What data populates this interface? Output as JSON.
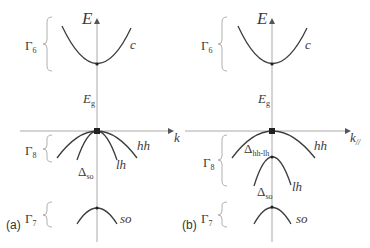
{
  "diagram": {
    "type": "band-structure",
    "panels": [
      {
        "tag": "(a)",
        "axis_y_label": "E",
        "axis_x_label": "k",
        "gap_label": "E",
        "gap_label_sub": "g",
        "bands": [
          {
            "name": "c",
            "region": "Γ6",
            "region_sub": "6"
          },
          {
            "name": "hh",
            "region": "Γ8"
          },
          {
            "name": "lh",
            "region": "Γ8"
          },
          {
            "name": "so",
            "region": "Γ7"
          }
        ],
        "regions": {
          "g6": "Γ",
          "g6_sub": "6",
          "g8": "Γ",
          "g8_sub": "8",
          "g7": "Γ",
          "g7_sub": "7"
        },
        "delta_so": "Δ",
        "delta_so_sub": "so"
      },
      {
        "tag": "(b)",
        "axis_y_label": "E",
        "axis_x_label": "k",
        "axis_x_sub": "//",
        "gap_label": "E",
        "gap_label_sub": "g",
        "bands": [
          {
            "name": "c"
          },
          {
            "name": "hh"
          },
          {
            "name": "lh"
          },
          {
            "name": "so"
          }
        ],
        "regions": {
          "g6": "Γ",
          "g6_sub": "6",
          "g8": "Γ",
          "g8_sub": "8",
          "g7": "Γ",
          "g7_sub": "7"
        },
        "delta_hhlh": "Δ",
        "delta_hhlh_sub": "hh-lh",
        "delta_so": "Δ",
        "delta_so_sub": "so"
      }
    ],
    "colors": {
      "axis": "#aaaaaa",
      "curve": "#3d3d3d",
      "brace": "#b0b0b0",
      "text": "#3a3a3a"
    }
  }
}
